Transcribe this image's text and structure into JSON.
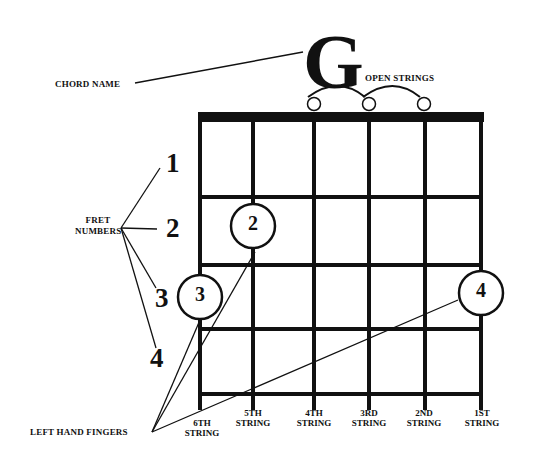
{
  "chord": {
    "name": "G",
    "label": "CHORD NAME"
  },
  "open_strings_label": "OPEN STRINGS",
  "fret_numbers_label": [
    "FRET",
    "NUMBERS"
  ],
  "fret_numbers": [
    "1",
    "2",
    "3",
    "4"
  ],
  "left_hand_fingers_label": "LEFT HAND FINGERS",
  "strings": [
    {
      "line1": "6TH",
      "line2": "STRING"
    },
    {
      "line1": "5TH",
      "line2": "STRING"
    },
    {
      "line1": "4TH",
      "line2": "STRING"
    },
    {
      "line1": "3RD",
      "line2": "STRING"
    },
    {
      "line1": "2ND",
      "line2": "STRING"
    },
    {
      "line1": "1ST",
      "line2": "STRING"
    }
  ],
  "fingers": [
    {
      "finger": "2",
      "string": "5th",
      "fret": 2
    },
    {
      "finger": "3",
      "string": "6th",
      "fret": 3
    },
    {
      "finger": "4",
      "string": "1st",
      "fret": 3
    }
  ],
  "open": [
    "4th",
    "3rd",
    "2nd"
  ],
  "colors": {
    "ink": "#111111",
    "background": "#ffffff"
  }
}
